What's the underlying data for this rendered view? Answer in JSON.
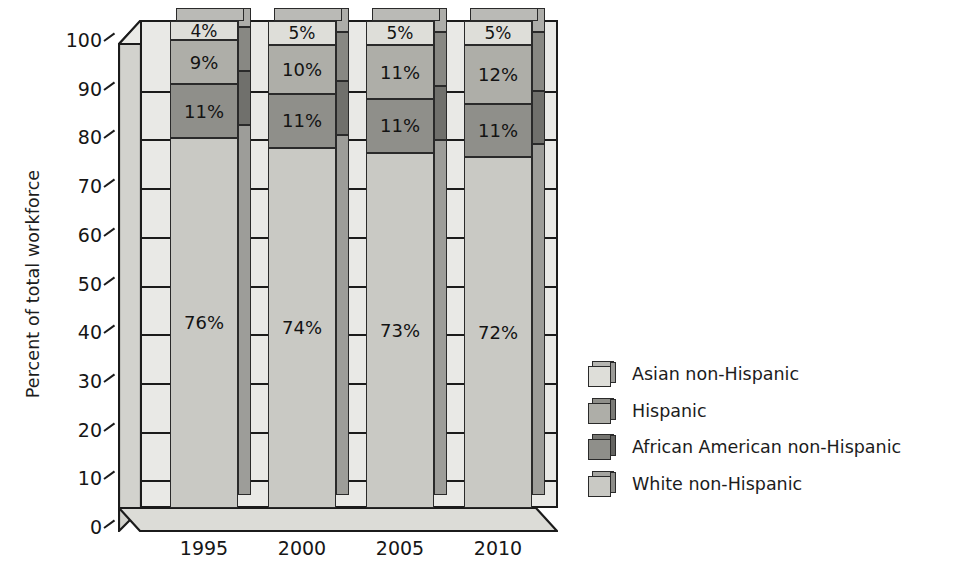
{
  "chart_data": {
    "type": "bar",
    "stacked": true,
    "title": "",
    "xlabel": "",
    "ylabel": "Percent of total workforce",
    "categories": [
      "1995",
      "2000",
      "2005",
      "2010"
    ],
    "ylim": [
      0,
      100
    ],
    "yticks": [
      0,
      10,
      20,
      30,
      40,
      50,
      60,
      70,
      80,
      90,
      100
    ],
    "ytick_labels": [
      "0",
      "10",
      "20",
      "30",
      "40",
      "50",
      "60",
      "70",
      "80",
      "90",
      "100"
    ],
    "grid": true,
    "legend_position": "right",
    "series": [
      {
        "name": "White non-Hispanic",
        "color": "#c9c9c4",
        "values": [
          76,
          74,
          73,
          72
        ],
        "labels": [
          "76%",
          "74%",
          "73%",
          "72%"
        ]
      },
      {
        "name": "African American non-Hispanic",
        "color": "#8f8f8a",
        "values": [
          11,
          11,
          11,
          11
        ],
        "labels": [
          "11%",
          "11%",
          "11%",
          "11%"
        ]
      },
      {
        "name": "Hispanic",
        "color": "#aeaea8",
        "values": [
          9,
          10,
          11,
          12
        ],
        "labels": [
          "9%",
          "10%",
          "11%",
          "12%"
        ]
      },
      {
        "name": "Asian non-Hispanic",
        "color": "#dedeD9",
        "values": [
          4,
          5,
          5,
          5
        ],
        "labels": [
          "4%",
          "5%",
          "5%",
          "5%"
        ]
      }
    ],
    "legend_entries": [
      {
        "label": "Asian non-Hispanic",
        "color": "#dedeD9"
      },
      {
        "label": "Hispanic",
        "color": "#aeaea8"
      },
      {
        "label": "African American non-Hispanic",
        "color": "#8f8f8a"
      },
      {
        "label": "White non-Hispanic",
        "color": "#c9c9c4"
      }
    ],
    "colors": {
      "plot_background": "#e9e9e6",
      "axis": "#1b1b1b",
      "wall": "#d2d2cd",
      "floor": "#dcdcd7",
      "text": "#161616"
    }
  }
}
